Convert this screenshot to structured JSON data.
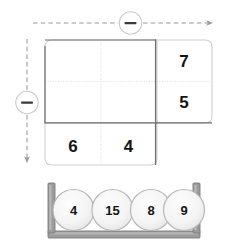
{
  "puzzle": {
    "title": "Number grid subtraction puzzle",
    "axes": {
      "horizontal": {
        "operator_label": "−",
        "operator_icon": "minus-circle-icon",
        "direction": "right",
        "style": "dashed"
      },
      "vertical": {
        "operator_label": "−",
        "operator_icon": "minus-circle-icon",
        "direction": "down",
        "style": "dashed"
      }
    },
    "grid": {
      "left_block": {
        "rows": 2,
        "cols": 2,
        "cells": [
          {
            "value": "",
            "row": 0,
            "col": 0
          },
          {
            "value": "",
            "row": 0,
            "col": 1
          },
          {
            "value": "",
            "row": 1,
            "col": 0
          },
          {
            "value": "",
            "row": 1,
            "col": 1
          }
        ]
      },
      "right_column": {
        "cells": [
          {
            "value": "7",
            "row": 0
          },
          {
            "value": "5",
            "row": 1
          }
        ]
      },
      "bottom_row": {
        "cells": [
          {
            "value": "6",
            "col": 0
          },
          {
            "value": "4",
            "col": 1
          }
        ]
      }
    },
    "tray": {
      "name": "number-tile-tray",
      "tiles": [
        {
          "value": "4"
        },
        {
          "value": "15"
        },
        {
          "value": "8"
        },
        {
          "value": "9"
        }
      ]
    }
  },
  "colors": {
    "page_background": "#ffffff",
    "grid_border": "#6e6e6e",
    "grid_inner_line": "#d8d8d8",
    "outer_outline": "#cfcfcf",
    "arrow": "#9a9a9a",
    "operator_circle": "#c9c9c9",
    "operator_glyph": "#3a3a3a",
    "text": "#141414",
    "tray_frame": "#8a8a8a",
    "tray_frame_dark": "#6f6f6f",
    "tile_fill": "#f4f4f4",
    "tile_stroke": "#b5b5b5"
  }
}
